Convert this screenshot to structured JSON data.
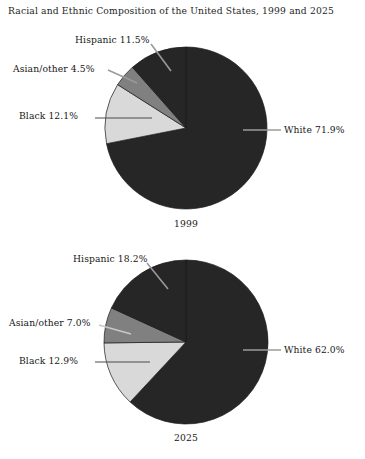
{
  "chart_data": {
    "type": "pie",
    "title": "Racial and Ethnic Composition of the United States, 1999 and 2025",
    "xlabel": "",
    "ylabel": "",
    "legend_position": "none-callout-labels",
    "grid": false,
    "charts": [
      {
        "name": "1999",
        "year_label": "1999",
        "start_angle_deg": 0,
        "direction": "clockwise",
        "center": {
          "x": 186,
          "y": 128
        },
        "radius": 81,
        "categories": [
          "White",
          "Black",
          "Asian/other",
          "Hispanic"
        ],
        "values": [
          71.9,
          12.1,
          4.5,
          11.5
        ],
        "slices": [
          {
            "name": "White",
            "value": 71.9,
            "label": "White 71.9%",
            "color": "#262626"
          },
          {
            "name": "Black",
            "value": 12.1,
            "label": "Black 12.1%",
            "color": "#d9d9d9"
          },
          {
            "name": "Asian/other",
            "value": 4.5,
            "label": "Asian/other 4.5%",
            "color": "#808080"
          },
          {
            "name": "Hispanic",
            "value": 11.5,
            "label": "Hispanic 11.5%",
            "color": "#262626"
          }
        ]
      },
      {
        "name": "2025",
        "year_label": "2025",
        "start_angle_deg": 0,
        "direction": "clockwise",
        "center": {
          "x": 186,
          "y": 342
        },
        "radius": 82,
        "categories": [
          "White",
          "Black",
          "Asian/other",
          "Hispanic"
        ],
        "values": [
          62.0,
          12.9,
          7.0,
          18.2
        ],
        "slices": [
          {
            "name": "White",
            "value": 62.0,
            "label": "White 62.0%",
            "color": "#262626"
          },
          {
            "name": "Black",
            "value": 12.9,
            "label": "Black 12.9%",
            "color": "#d9d9d9"
          },
          {
            "name": "Asian/other",
            "value": 7.0,
            "label": "Asian/other 7.0%",
            "color": "#808080"
          },
          {
            "name": "Hispanic",
            "value": 18.2,
            "label": "Hispanic 18.2%",
            "color": "#262626"
          }
        ]
      }
    ]
  },
  "figure": {
    "title": "Racial and Ethnic Composition of the United States, 1999 and 2025",
    "background_color": "#ffffff",
    "pie1": {
      "year": "1999",
      "white": "White 71.9%",
      "black": "Black 12.1%",
      "asian": "Asian/other 4.5%",
      "hispanic": "Hispanic 11.5%"
    },
    "pie2": {
      "year": "2025",
      "white": "White 62.0%",
      "black": "Black 12.9%",
      "asian": "Asian/other 7.0%",
      "hispanic": "Hispanic 18.2%"
    }
  }
}
